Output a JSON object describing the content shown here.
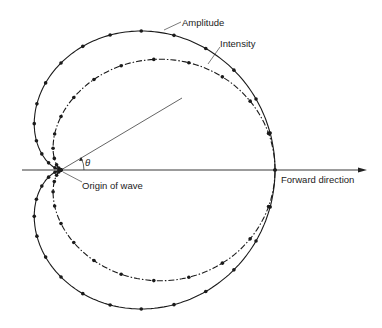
{
  "diagram": {
    "labels": {
      "amplitude": "Amplitude",
      "intensity": "Intensity",
      "origin": "Origin of wave",
      "forward": "Forward direction",
      "theta": "θ"
    },
    "curves": [
      {
        "name": "Amplitude",
        "equation": "r = a(1 + cos θ)",
        "style": "solid with dots"
      },
      {
        "name": "Intensity",
        "equation": "r = a(1 + cos θ)² / 2",
        "style": "dash-dot with dots"
      }
    ],
    "colors": {
      "line": "#1a1a1a",
      "background": "#ffffff"
    }
  }
}
